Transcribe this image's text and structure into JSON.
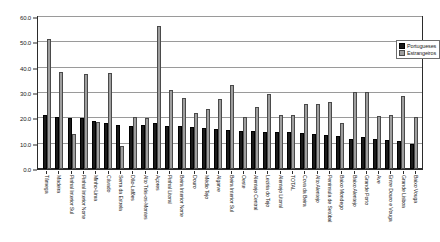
{
  "chart_data": {
    "type": "bar",
    "title": "",
    "subtitle": "",
    "xlabel": "",
    "ylabel": "",
    "ylim": [
      0.0,
      60.0
    ],
    "ytick_step": 10.0,
    "ytick_labels": [
      "60.0",
      "50.0",
      "40.0",
      "30.0",
      "20.0",
      "10.0",
      "0.0"
    ],
    "ytick_values": [
      60.0,
      50.0,
      40.0,
      30.0,
      20.0,
      10.0,
      0.0
    ],
    "grid": true,
    "grid_orientation": "horizontal",
    "legend_position": "top-right-inside",
    "orientation": "vertical",
    "categories": [
      "Tâmega",
      "Madeira",
      "Pinhal Interior Sul",
      "Pinhal Interior Norte",
      "Minho-Lima",
      "Cávado",
      "Serra da Estrela",
      "Dão-Lafões",
      "Alto Trás-os-Montes",
      "Açores",
      "Pinhal Litoral",
      "Beira Interior Norte",
      "Douro",
      "Médio Tejo",
      "Algarve",
      "Beira Interior Sul",
      "Oeste",
      "Alentejo Central",
      "Lezíria do Tejo",
      "Alentejo Litoral",
      "TOTAL",
      "Cova da Beira",
      "Alto Alentejo",
      "Península de Setúbal",
      "Baixo Mondego",
      "Baixo Alentejo",
      "Grande Porto",
      "Ave",
      "Entre Douro e Vouga",
      "Grande Lisboa",
      "Baixo Vouga"
    ],
    "series": [
      {
        "name": "Portugueses",
        "color": "#1a1a1a",
        "values": [
          21.5,
          20.5,
          20.0,
          20.0,
          18.8,
          18.3,
          17.5,
          17.0,
          17.5,
          18.0,
          16.8,
          17.0,
          16.5,
          16.0,
          15.8,
          15.5,
          15.2,
          15.0,
          14.8,
          14.5,
          14.5,
          14.2,
          14.0,
          13.5,
          13.2,
          12.0,
          12.5,
          12.0,
          11.5,
          11.0,
          10.0
        ]
      },
      {
        "name": "Estrangeiros",
        "color": "#9e9e9e",
        "values": [
          51.5,
          38.2,
          14.0,
          37.5,
          18.5,
          37.8,
          9.0,
          20.5,
          20.0,
          56.5,
          31.0,
          28.0,
          22.0,
          23.5,
          27.5,
          33.0,
          20.5,
          24.5,
          29.5,
          21.5,
          21.5,
          25.5,
          25.5,
          26.5,
          18.0,
          30.5,
          30.5,
          21.0,
          21.5,
          29.0,
          20.5
        ]
      }
    ]
  },
  "legend": {
    "items": [
      {
        "label": "Portugueses",
        "marker": "legend-swatch-portugueses"
      },
      {
        "label": "Estrangeiros",
        "marker": "legend-swatch-estrangeiros"
      }
    ]
  },
  "colors": {
    "series_portugueses": "#1a1a1a",
    "series_estrangeiros": "#9e9e9e",
    "gridline": "#9a9a9a",
    "axis": "#2b2b2b",
    "background": "#ffffff"
  }
}
